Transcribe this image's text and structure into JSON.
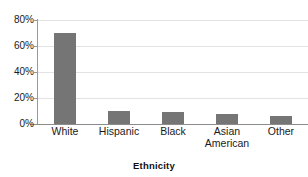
{
  "chart_data": {
    "type": "bar",
    "title": "",
    "subtitle": "",
    "xlabel": "Ethnicity",
    "ylabel": "",
    "categories": [
      "White",
      "Hispanic",
      "Black",
      "Asian American",
      "Other"
    ],
    "category_lines": [
      [
        "White"
      ],
      [
        "Hispanic"
      ],
      [
        "Black"
      ],
      [
        "Asian",
        "American"
      ],
      [
        "Other"
      ]
    ],
    "values": [
      70,
      10,
      9,
      8,
      6
    ],
    "ylim": [
      0,
      80
    ],
    "ytick_values": [
      0,
      20,
      40,
      60,
      80
    ],
    "ytick_labels": [
      "0%",
      "20%",
      "40%",
      "60%",
      "80%"
    ],
    "grid": true,
    "grid_axis": "y",
    "legend": false,
    "legend_position": "none",
    "bar_color": "#757575",
    "gridline_color": "#e3e3e3",
    "axis_color": "#8c8c8c",
    "background_color": "#ffffff",
    "text_color": "#1a1a1a"
  }
}
